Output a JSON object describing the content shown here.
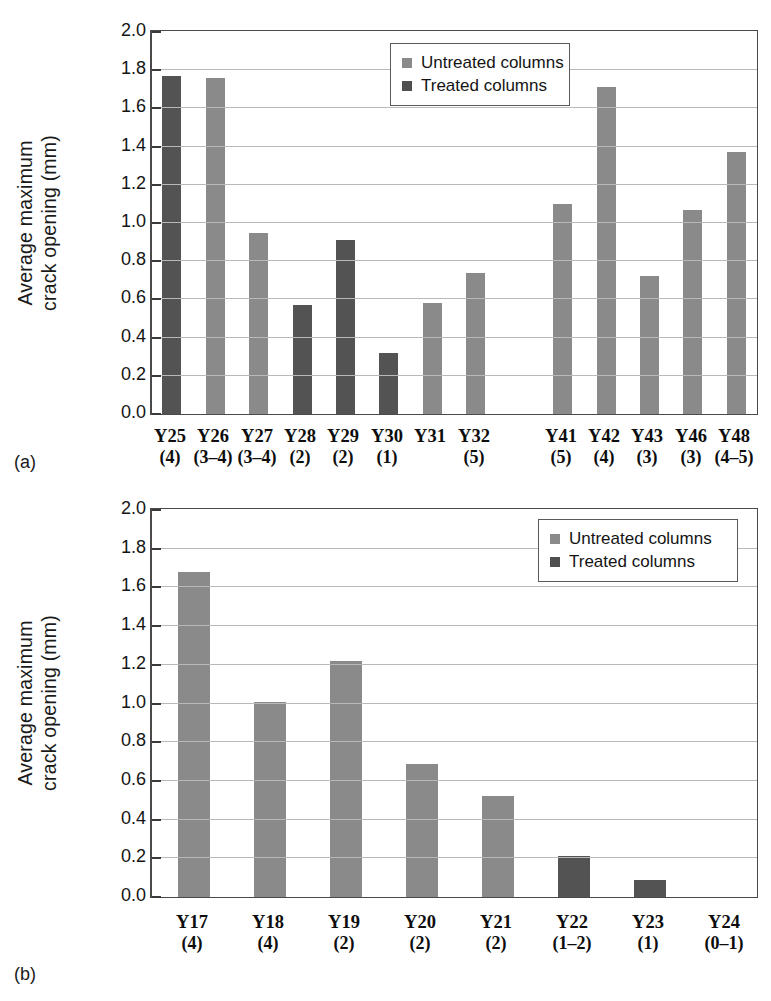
{
  "figure": {
    "panel_a_label": "(a)",
    "panel_b_label": "(b)"
  },
  "axis": {
    "ylabel_line1": "Average maximum",
    "ylabel_line2": "crack opening (mm)",
    "yticks": [
      "0.0",
      "0.2",
      "0.4",
      "0.6",
      "0.8",
      "1.0",
      "1.2",
      "1.4",
      "1.6",
      "1.8",
      "2.0"
    ]
  },
  "legend": {
    "untreated": "Untreated columns",
    "treated": "Treated columns"
  },
  "colors": {
    "untreated": "#8a8a8a",
    "treated": "#535353",
    "gridline": "#b9b9b9",
    "axis": "#4a4a4a"
  },
  "chart_data": [
    {
      "type": "bar",
      "panel": "(a)",
      "title": "",
      "xlabel": "",
      "ylabel": "Average maximum crack opening (mm)",
      "ylim": [
        0,
        2.0
      ],
      "ytick_step": 0.2,
      "grid": true,
      "legend_position": "top-center",
      "series": [
        {
          "name": "Untreated columns",
          "color": "#8a8a8a"
        },
        {
          "name": "Treated columns",
          "color": "#535353"
        }
      ],
      "categories": [
        "Y25",
        "Y26",
        "Y27",
        "Y28",
        "Y29",
        "Y30",
        "Y31",
        "Y32",
        "",
        "Y41",
        "Y42",
        "Y43",
        "Y46",
        "Y48"
      ],
      "category_sublabels": [
        "(4)",
        "(3–4)",
        "(3–4)",
        "(2)",
        "(2)",
        "(1)",
        "",
        "(5)",
        "",
        "(5)",
        "(4)",
        "(3)",
        "(3)",
        "(4–5)"
      ],
      "points": [
        {
          "category": "Y25",
          "sublabel": "(4)",
          "value": 1.77,
          "series": "Treated columns"
        },
        {
          "category": "Y26",
          "sublabel": "(3–4)",
          "value": 1.76,
          "series": "Untreated columns"
        },
        {
          "category": "Y27",
          "sublabel": "(3–4)",
          "value": 0.95,
          "series": "Untreated columns"
        },
        {
          "category": "Y28",
          "sublabel": "(2)",
          "value": 0.57,
          "series": "Treated columns"
        },
        {
          "category": "Y29",
          "sublabel": "(2)",
          "value": 0.91,
          "series": "Treated columns"
        },
        {
          "category": "Y30",
          "sublabel": "(1)",
          "value": 0.32,
          "series": "Treated columns"
        },
        {
          "category": "Y31",
          "sublabel": "",
          "value": 0.58,
          "series": "Untreated columns"
        },
        {
          "category": "Y32",
          "sublabel": "(5)",
          "value": 0.74,
          "series": "Untreated columns"
        },
        {
          "category": "",
          "sublabel": "",
          "value": 0.0,
          "series": "Untreated columns"
        },
        {
          "category": "Y41",
          "sublabel": "(5)",
          "value": 1.1,
          "series": "Untreated columns"
        },
        {
          "category": "Y42",
          "sublabel": "(4)",
          "value": 1.71,
          "series": "Untreated columns"
        },
        {
          "category": "Y43",
          "sublabel": "(3)",
          "value": 0.72,
          "series": "Untreated columns"
        },
        {
          "category": "Y46",
          "sublabel": "(3)",
          "value": 1.07,
          "series": "Untreated columns"
        },
        {
          "category": "Y48",
          "sublabel": "(4–5)",
          "value": 1.37,
          "series": "Untreated columns"
        }
      ]
    },
    {
      "type": "bar",
      "panel": "(b)",
      "title": "",
      "xlabel": "",
      "ylabel": "Average maximum crack opening (mm)",
      "ylim": [
        0,
        2.0
      ],
      "ytick_step": 0.2,
      "grid": true,
      "legend_position": "top-right",
      "series": [
        {
          "name": "Untreated columns",
          "color": "#8a8a8a"
        },
        {
          "name": "Treated columns",
          "color": "#535353"
        }
      ],
      "categories": [
        "Y17",
        "Y18",
        "Y19",
        "Y20",
        "Y21",
        "Y22",
        "Y23",
        "Y24"
      ],
      "category_sublabels": [
        "(4)",
        "(4)",
        "(2)",
        "(2)",
        "(2)",
        "(1–2)",
        "(1)",
        "(0–1)"
      ],
      "points": [
        {
          "category": "Y17",
          "sublabel": "(4)",
          "value": 1.68,
          "series": "Untreated columns"
        },
        {
          "category": "Y18",
          "sublabel": "(4)",
          "value": 1.01,
          "series": "Untreated columns"
        },
        {
          "category": "Y19",
          "sublabel": "(2)",
          "value": 1.22,
          "series": "Untreated columns"
        },
        {
          "category": "Y20",
          "sublabel": "(2)",
          "value": 0.69,
          "series": "Untreated columns"
        },
        {
          "category": "Y21",
          "sublabel": "(2)",
          "value": 0.52,
          "series": "Untreated columns"
        },
        {
          "category": "Y22",
          "sublabel": "(1–2)",
          "value": 0.21,
          "series": "Treated columns"
        },
        {
          "category": "Y23",
          "sublabel": "(1)",
          "value": 0.09,
          "series": "Treated columns"
        },
        {
          "category": "Y24",
          "sublabel": "(0–1)",
          "value": 0.0,
          "series": "Untreated columns"
        }
      ]
    }
  ]
}
